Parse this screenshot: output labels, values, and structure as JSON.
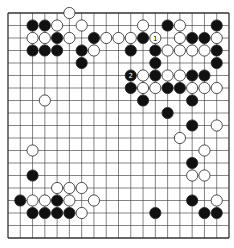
{
  "board": {
    "size": 19,
    "colors": {
      "line": "#333333",
      "black": "#111111",
      "white": "#ffffff",
      "background": "#ffffff"
    },
    "black_stones": [
      [
        2,
        1
      ],
      [
        3,
        1
      ],
      [
        13,
        1
      ],
      [
        17,
        1
      ],
      [
        4,
        2
      ],
      [
        7,
        2
      ],
      [
        11,
        2
      ],
      [
        15,
        2
      ],
      [
        16,
        2
      ],
      [
        2,
        3
      ],
      [
        3,
        3
      ],
      [
        4,
        3
      ],
      [
        6,
        3
      ],
      [
        10,
        3
      ],
      [
        12,
        3
      ],
      [
        17,
        3
      ],
      [
        6,
        4
      ],
      [
        12,
        4
      ],
      [
        17,
        4
      ],
      [
        10,
        5
      ],
      [
        12,
        5
      ],
      [
        15,
        5
      ],
      [
        16,
        5
      ],
      [
        10,
        6
      ],
      [
        13,
        6
      ],
      [
        14,
        6
      ],
      [
        11,
        7
      ],
      [
        15,
        7
      ],
      [
        13,
        8
      ],
      [
        15,
        9
      ],
      [
        15,
        12
      ],
      [
        2,
        13
      ],
      [
        1,
        15
      ],
      [
        4,
        15
      ],
      [
        15,
        15
      ],
      [
        2,
        16
      ],
      [
        3,
        16
      ],
      [
        4,
        16
      ],
      [
        5,
        16
      ],
      [
        12,
        16
      ],
      [
        16,
        16
      ],
      [
        17,
        16
      ]
    ],
    "white_stones": [
      [
        5,
        0
      ],
      [
        4,
        1
      ],
      [
        6,
        1
      ],
      [
        11,
        1
      ],
      [
        14,
        1
      ],
      [
        2,
        2
      ],
      [
        3,
        2
      ],
      [
        5,
        2
      ],
      [
        8,
        2
      ],
      [
        9,
        2
      ],
      [
        10,
        2
      ],
      [
        12,
        2
      ],
      [
        14,
        2
      ],
      [
        17,
        2
      ],
      [
        7,
        3
      ],
      [
        13,
        3
      ],
      [
        14,
        3
      ],
      [
        15,
        3
      ],
      [
        16,
        3
      ],
      [
        11,
        5
      ],
      [
        13,
        5
      ],
      [
        14,
        5
      ],
      [
        11,
        6
      ],
      [
        12,
        6
      ],
      [
        15,
        6
      ],
      [
        16,
        6
      ],
      [
        17,
        6
      ],
      [
        3,
        7
      ],
      [
        17,
        9
      ],
      [
        14,
        10
      ],
      [
        2,
        11
      ],
      [
        16,
        11
      ],
      [
        15,
        13
      ],
      [
        16,
        13
      ],
      [
        4,
        14
      ],
      [
        5,
        14
      ],
      [
        6,
        14
      ],
      [
        2,
        15
      ],
      [
        3,
        15
      ],
      [
        5,
        15
      ],
      [
        7,
        15
      ],
      [
        17,
        15
      ],
      [
        6,
        16
      ]
    ],
    "labels": [
      {
        "col": 12,
        "row": 2,
        "text": "1",
        "stone": "white"
      },
      {
        "col": 10,
        "row": 5,
        "text": "2",
        "stone": "black"
      }
    ]
  }
}
